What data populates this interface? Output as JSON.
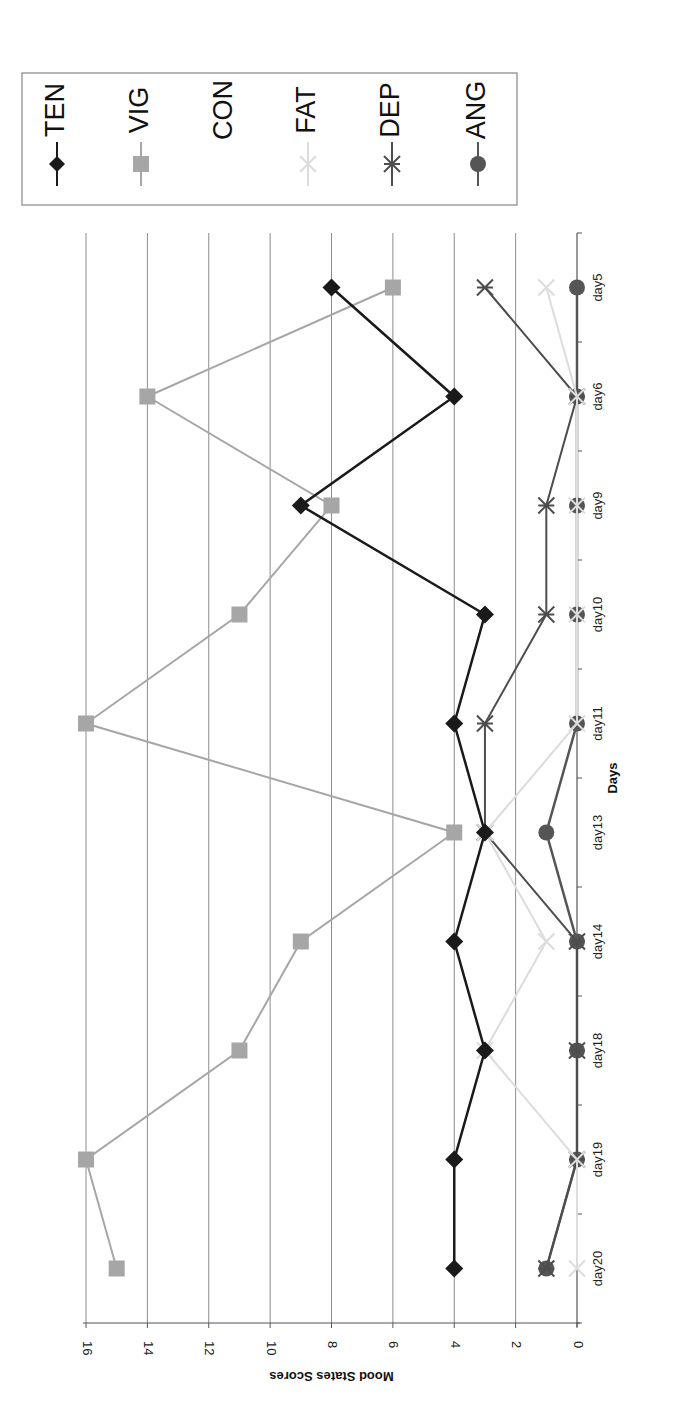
{
  "chart_data": {
    "type": "line",
    "orientation": "rotated-90-clockwise",
    "title": "",
    "xlabel": "Days",
    "ylabel": "Mood States Scores",
    "ylim": [
      0,
      16
    ],
    "yticks": [
      0,
      2,
      4,
      6,
      8,
      10,
      12,
      14,
      16
    ],
    "grid": true,
    "legend_position": "right",
    "categories": [
      "day5",
      "day6",
      "day9",
      "day10",
      "day11",
      "day13",
      "day14",
      "day18",
      "day19",
      "day20"
    ],
    "series": [
      {
        "name": "TEN",
        "marker": "diamond",
        "color": "#1a1a1a",
        "values": [
          8,
          4,
          9,
          3,
          4,
          3,
          4,
          3,
          4,
          4
        ]
      },
      {
        "name": "VIG",
        "marker": "square",
        "color": "#a6a6a6",
        "values": [
          6,
          14,
          8,
          11,
          16,
          4,
          9,
          11,
          16,
          15
        ]
      },
      {
        "name": "CON",
        "marker": "none",
        "color": "#ffffff",
        "values": [
          0,
          0,
          0,
          0,
          0,
          0,
          0,
          0,
          0,
          0
        ]
      },
      {
        "name": "FAT",
        "marker": "x",
        "color": "#dcdcdc",
        "values": [
          1,
          0,
          0,
          0,
          0,
          3,
          1,
          3,
          0,
          0
        ]
      },
      {
        "name": "DEP",
        "marker": "asterisk",
        "color": "#4d4d4d",
        "values": [
          3,
          0,
          1,
          1,
          3,
          3,
          0,
          0,
          0,
          1
        ]
      },
      {
        "name": "ANG",
        "marker": "circle",
        "color": "#555555",
        "values": [
          0,
          0,
          0,
          0,
          0,
          1,
          0,
          0,
          0,
          1
        ]
      }
    ]
  }
}
